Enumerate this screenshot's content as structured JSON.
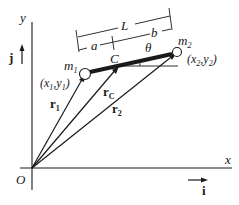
{
  "diagram": {
    "axes": {
      "x_label": "x",
      "y_label": "y",
      "origin_label": "O",
      "i_unit_label": "i",
      "j_unit_label": "j"
    },
    "masses": {
      "m1": {
        "name": "m",
        "sub": "1",
        "coord": "(x",
        "coord_sub1": "1",
        "coord_mid": ",y",
        "coord_sub2": "1",
        "coord_end": ")"
      },
      "m2": {
        "name": "m",
        "sub": "2",
        "coord": "(x",
        "coord_sub1": "2",
        "coord_mid": ",y",
        "coord_sub2": "2",
        "coord_end": ")"
      }
    },
    "center_label": "C",
    "angle_label": "θ",
    "dimensions": {
      "L": "L",
      "a": "a",
      "b": "b"
    },
    "vectors": {
      "r1": {
        "name": "r",
        "sub": "1"
      },
      "rC": {
        "name": "r",
        "sub": "C"
      },
      "r2": {
        "name": "r",
        "sub": "2"
      }
    },
    "colors": {
      "ink": "#1a1a1a",
      "background": "#ffffff"
    }
  }
}
